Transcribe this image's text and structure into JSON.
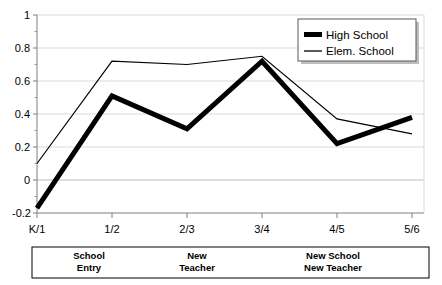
{
  "chart_data": {
    "type": "line",
    "title": "",
    "xlabel": "",
    "ylabel": "",
    "x": [
      "K/1",
      "1/2",
      "2/3",
      "3/4",
      "4/5",
      "5/6"
    ],
    "categories": [
      "K/1",
      "1/2",
      "2/3",
      "3/4",
      "4/5",
      "5/6"
    ],
    "series": [
      {
        "name": "High School",
        "style": "thick-black",
        "values": [
          -0.17,
          0.51,
          0.31,
          0.72,
          0.22,
          0.38
        ]
      },
      {
        "name": "Elem. School",
        "style": "thin-black",
        "values": [
          0.1,
          0.72,
          0.7,
          0.75,
          0.37,
          0.28
        ]
      }
    ],
    "ylim": [
      -0.2,
      1.0
    ],
    "yticks": [
      -0.2,
      0,
      0.2,
      0.4,
      0.6,
      0.8,
      1
    ],
    "ytick_labels": [
      "-0.2",
      "0",
      "0.2",
      "0.4",
      "0.6",
      "0.8",
      "1"
    ],
    "grid": true,
    "grid_color": "#d9d9d9",
    "legend_position": "top-right",
    "annotations": [
      {
        "label_line1": "School",
        "label_line2": "Entry",
        "span_start": "K/1",
        "span_end": "1/2"
      },
      {
        "label_line1": "New",
        "label_line2": "Teacher",
        "span_start": "2/3",
        "span_end": "3/4"
      },
      {
        "label_line1": "New School",
        "label_line2": "New Teacher",
        "span_start": "4/5",
        "span_end": "5/6"
      }
    ]
  },
  "legend": {
    "entries": [
      {
        "label": "High School",
        "marker": "thick-line-swatch"
      },
      {
        "label": "Elem. School",
        "marker": "thin-line-swatch"
      }
    ]
  },
  "axis": {
    "y_labels": [
      "1",
      "0.8",
      "0.6",
      "0.4",
      "0.2",
      "0",
      "-0.2"
    ],
    "x_labels": [
      "K/1",
      "1/2",
      "2/3",
      "3/4",
      "4/5",
      "5/6"
    ]
  },
  "annotation_bar": {
    "groups": [
      {
        "line1": "School",
        "line2": "Entry"
      },
      {
        "line1": "New",
        "line2": "Teacher"
      },
      {
        "line1": "New School",
        "line2": "New Teacher"
      }
    ]
  },
  "colors": {
    "line": "#000000",
    "grid": "#d9d9d9",
    "axis": "#808080",
    "background": "#ffffff"
  }
}
